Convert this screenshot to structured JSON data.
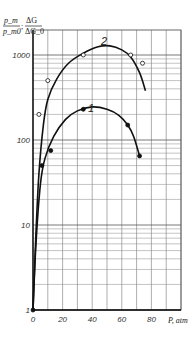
{
  "chart_data": {
    "type": "line",
    "title": "",
    "xlabel": "P, atm",
    "ylabel": "p_m / p_m0 ; ΔG / ΔG_0",
    "yscale": "log",
    "xlim": [
      0,
      100
    ],
    "ylim": [
      1,
      3000
    ],
    "x_ticks": [
      "0",
      "20",
      "40",
      "60",
      "80"
    ],
    "y_ticks": [
      "1",
      "10",
      "100",
      "1000"
    ],
    "grid": true,
    "legend": "inline curve labels",
    "series": [
      {
        "name": "1",
        "marker": "filled-circle",
        "points": [
          [
            0,
            1
          ],
          [
            6,
            50
          ],
          [
            12,
            75
          ],
          [
            34,
            230
          ],
          [
            64,
            150
          ],
          [
            72,
            65
          ]
        ],
        "curve": [
          [
            0,
            1
          ],
          [
            2,
            6
          ],
          [
            5,
            30
          ],
          [
            8,
            60
          ],
          [
            14,
            110
          ],
          [
            22,
            175
          ],
          [
            30,
            220
          ],
          [
            40,
            245
          ],
          [
            50,
            230
          ],
          [
            58,
            195
          ],
          [
            64,
            150
          ],
          [
            68,
            110
          ],
          [
            72,
            65
          ]
        ]
      },
      {
        "name": "2",
        "marker": "open-circle",
        "points": [
          [
            4,
            200
          ],
          [
            10,
            500
          ],
          [
            34,
            1000
          ],
          [
            66,
            1000
          ],
          [
            74,
            800
          ]
        ],
        "curve": [
          [
            0,
            1
          ],
          [
            2,
            8
          ],
          [
            4,
            40
          ],
          [
            7,
            150
          ],
          [
            10,
            300
          ],
          [
            16,
            520
          ],
          [
            24,
            800
          ],
          [
            34,
            1050
          ],
          [
            44,
            1250
          ],
          [
            52,
            1280
          ],
          [
            60,
            1150
          ],
          [
            66,
            950
          ],
          [
            72,
            620
          ],
          [
            76,
            380
          ]
        ]
      }
    ]
  },
  "labels": {
    "y_axis_top": "p_m",
    "y_axis_bottom": "p_m0",
    "y_axis_sep": ";",
    "y_axis_right_top": "ΔG",
    "y_axis_right_bottom": "ΔG_0",
    "x_axis": "P, atm",
    "curve_1": "1",
    "curve_2": "2"
  }
}
